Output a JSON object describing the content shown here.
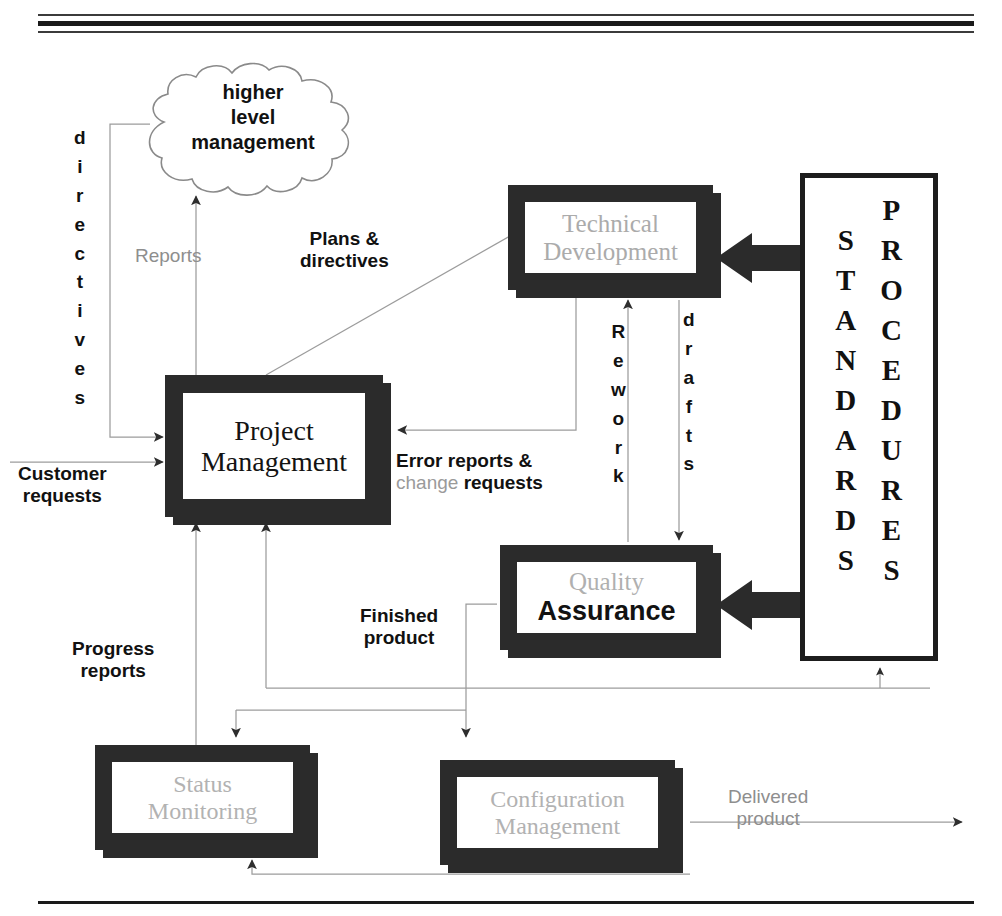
{
  "diagram": {
    "cloud": {
      "name": "higher-level-management",
      "line1": "higher",
      "line2": "level",
      "line3": "management"
    },
    "boxes": [
      {
        "id": "project-management",
        "line1": "Project",
        "line2": "Management",
        "tone": "dark"
      },
      {
        "id": "technical-development",
        "line1": "Technical",
        "line2": "Development",
        "tone": "light"
      },
      {
        "id": "quality-assurance",
        "line1": "Quality",
        "line2": "Assurance",
        "tone": "mixed"
      },
      {
        "id": "status-monitoring",
        "line1": "Status",
        "line2": "Monitoring",
        "tone": "light"
      },
      {
        "id": "configuration-management",
        "line1": "Configuration",
        "line2": "Management",
        "tone": "light"
      }
    ],
    "reference_box": {
      "standards": "STANDARDS",
      "procedures": "PROCEDURES"
    },
    "labels": {
      "directives_vertical": "directives",
      "reports": "Reports",
      "plans_and_directives_l1": "Plans &",
      "plans_and_directives_l2": "directives",
      "customer_requests_l1": "Customer",
      "customer_requests_l2": "requests",
      "error_reports_l1": "Error reports &",
      "error_change": "change",
      "error_requests": "requests",
      "rework_vertical": "Rework",
      "drafts_vertical": "drafts",
      "progress_reports_l1": "Progress",
      "progress_reports_l2": "reports",
      "finished_product_l1": "Finished",
      "finished_product_l2": "product",
      "delivered_product_l1": "Delivered",
      "delivered_product_l2": "product"
    },
    "colors": {
      "box_frame": "#2b2b2b",
      "box_fill": "#ffffff",
      "dark_text": "#111111",
      "light_text": "#a8a8a8",
      "connector": "#9c9c9c",
      "thick_arrow": "#2b2b2b"
    }
  }
}
